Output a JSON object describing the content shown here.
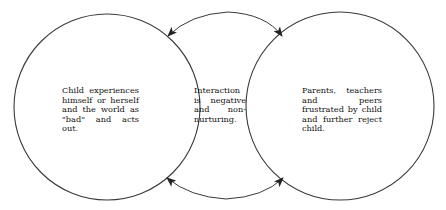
{
  "diagram": {
    "type": "cycle",
    "stroke_color": "#333333",
    "nodes": [
      {
        "id": "child",
        "text": "Child experiences himself or herself and the world as \"bad\" and acts out."
      },
      {
        "id": "interaction",
        "text": "Interaction is negative and non-nurturing."
      },
      {
        "id": "adults",
        "text": "Parents, teachers and peers frustrated by child and further reject child."
      }
    ],
    "edges": [
      {
        "from": "adults",
        "to": "child",
        "position": "top"
      },
      {
        "from": "child",
        "to": "adults",
        "position": "top"
      },
      {
        "from": "child",
        "to": "adults",
        "position": "bottom"
      },
      {
        "from": "adults",
        "to": "child",
        "position": "bottom"
      }
    ]
  }
}
